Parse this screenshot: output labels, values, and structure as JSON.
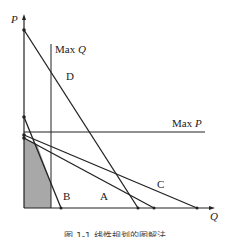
{
  "diagram": {
    "type": "linear-programming-graphical-method",
    "axes": {
      "y_label": "P",
      "x_label": "Q"
    },
    "constraints": [
      {
        "label": "Max Q",
        "kind": "vertical-bound"
      },
      {
        "label": "Max P",
        "kind": "horizontal-bound"
      }
    ],
    "lines": [
      {
        "label": "A"
      },
      {
        "label": "B"
      },
      {
        "label": "C"
      },
      {
        "label": "D"
      }
    ],
    "feasible_region": {
      "fill": "#a8a8a8",
      "description": "shaded feasible region"
    },
    "colors": {
      "line": "#222222",
      "shade": "#a8a8a8",
      "background": "#ffffff"
    },
    "caption": "图 1-1  线性规划的图解法"
  }
}
